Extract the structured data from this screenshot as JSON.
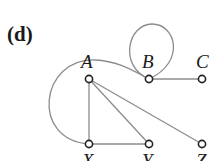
{
  "panel_label": "(d)",
  "colors": {
    "edge": "#8c8c8c",
    "node_stroke": "#222222",
    "node_fill": "#ffffff",
    "text": "#1a1a1a"
  },
  "nodes": [
    {
      "id": "A",
      "label": "A",
      "x": 89,
      "y": 79
    },
    {
      "id": "B",
      "label": "B",
      "x": 149,
      "y": 79
    },
    {
      "id": "C",
      "label": "C",
      "x": 202,
      "y": 79
    },
    {
      "id": "X",
      "label": "X",
      "x": 89,
      "y": 144
    },
    {
      "id": "Y",
      "label": "Y",
      "x": 149,
      "y": 144
    },
    {
      "id": "Z",
      "label": "Z",
      "x": 202,
      "y": 144
    }
  ],
  "edges": [
    {
      "from": "A",
      "to": "X",
      "type": "straight"
    },
    {
      "from": "A",
      "to": "Y",
      "type": "straight"
    },
    {
      "from": "A",
      "to": "Z",
      "type": "straight"
    },
    {
      "from": "X",
      "to": "Y",
      "type": "straight"
    },
    {
      "from": "B",
      "to": "C",
      "type": "straight"
    },
    {
      "from": "B",
      "to": "B",
      "type": "self-loop"
    },
    {
      "from": "X",
      "to": "B",
      "type": "curved"
    }
  ]
}
